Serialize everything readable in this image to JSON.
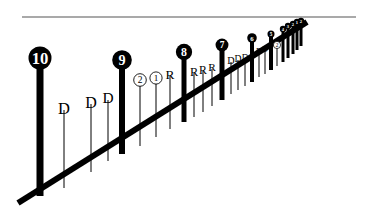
{
  "figure": {
    "type": "diagram",
    "background_color": "#ffffff",
    "ink_color": "#000000",
    "rule_color": "#555555"
  },
  "horizon_rule": {
    "name": "top-horizontal-line",
    "x1": 22,
    "y1": 17,
    "x2": 356,
    "y2": 17
  },
  "baseline": {
    "name": "diagonal-baseline",
    "x1": 18,
    "y1": 203,
    "x2": 307,
    "y2": 22,
    "thickness": 6
  },
  "bars": [
    {
      "label": "10",
      "marker": "filled-circle",
      "x": 40,
      "top": 58,
      "bottom": 196,
      "width": 7
    },
    {
      "label": "D",
      "marker": "plain-text",
      "x": 64,
      "top": 110,
      "bottom": 188,
      "width": 1
    },
    {
      "label": "D",
      "marker": "plain-text",
      "x": 91,
      "top": 104,
      "bottom": 172,
      "width": 1
    },
    {
      "label": "D",
      "marker": "plain-text",
      "x": 108,
      "top": 100,
      "bottom": 161,
      "width": 1
    },
    {
      "label": "9",
      "marker": "filled-circle",
      "x": 122,
      "top": 60,
      "bottom": 154,
      "width": 6
    },
    {
      "label": "2",
      "marker": "open-circle",
      "x": 140,
      "top": 80,
      "bottom": 146,
      "width": 1
    },
    {
      "label": "1",
      "marker": "open-circle",
      "x": 156,
      "top": 78,
      "bottom": 137,
      "width": 1
    },
    {
      "label": "R",
      "marker": "plain-text",
      "x": 170,
      "top": 76,
      "bottom": 129,
      "width": 1
    },
    {
      "label": "8",
      "marker": "filled-circle",
      "x": 184,
      "top": 52,
      "bottom": 122,
      "width": 5
    },
    {
      "label": "R",
      "marker": "plain-text",
      "x": 194,
      "top": 73,
      "bottom": 117,
      "width": 1
    },
    {
      "label": "R",
      "marker": "plain-text",
      "x": 203,
      "top": 71,
      "bottom": 112,
      "width": 1
    },
    {
      "label": "R",
      "marker": "plain-text",
      "x": 212,
      "top": 69,
      "bottom": 106,
      "width": 1
    },
    {
      "label": "7",
      "marker": "filled-circle",
      "x": 222,
      "top": 45,
      "bottom": 100,
      "width": 5
    },
    {
      "label": "D",
      "marker": "plain-text",
      "x": 231,
      "top": 62,
      "bottom": 94,
      "width": 1
    },
    {
      "label": "D",
      "marker": "plain-text",
      "x": 238,
      "top": 60,
      "bottom": 90,
      "width": 1
    },
    {
      "label": "D",
      "marker": "plain-text",
      "x": 245,
      "top": 58,
      "bottom": 86,
      "width": 1
    },
    {
      "label": "6",
      "marker": "filled-circle",
      "x": 252,
      "top": 38,
      "bottom": 82,
      "width": 4
    },
    {
      "label": "D",
      "marker": "plain-text",
      "x": 259,
      "top": 52,
      "bottom": 77,
      "width": 1
    },
    {
      "label": "D",
      "marker": "plain-text",
      "x": 265,
      "top": 50,
      "bottom": 74,
      "width": 1
    },
    {
      "label": "5",
      "marker": "filled-circle",
      "x": 271,
      "top": 34,
      "bottom": 70,
      "width": 4
    },
    {
      "label": "2",
      "marker": "open-circle",
      "x": 277,
      "top": 45,
      "bottom": 66,
      "width": 1
    },
    {
      "label": "4",
      "marker": "filled-circle",
      "x": 283,
      "top": 29,
      "bottom": 62,
      "width": 3
    },
    {
      "label": "3",
      "marker": "filled-circle",
      "x": 288,
      "top": 26,
      "bottom": 58,
      "width": 3
    },
    {
      "label": "2",
      "marker": "filled-circle",
      "x": 293,
      "top": 24,
      "bottom": 54,
      "width": 3
    },
    {
      "label": "1",
      "marker": "filled-circle",
      "x": 297,
      "top": 22,
      "bottom": 50,
      "width": 3
    },
    {
      "label": "2",
      "marker": "filled-circle",
      "x": 301,
      "top": 21,
      "bottom": 46,
      "width": 3
    }
  ],
  "marker_sizes": {
    "filled_circle_radii": [
      11,
      10,
      9,
      8,
      7,
      6,
      5,
      5,
      4,
      4
    ],
    "open_circle_radius": 6
  }
}
